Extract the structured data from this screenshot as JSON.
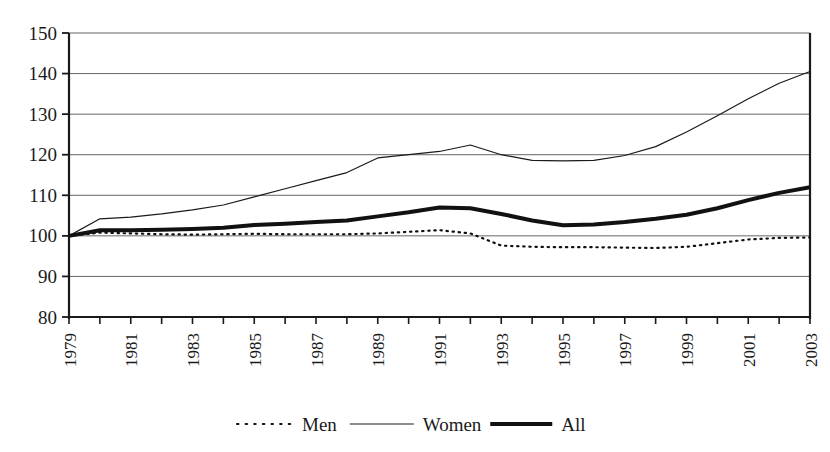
{
  "chart_data": {
    "type": "line",
    "title": "",
    "subtitle": "",
    "xlabel": "",
    "ylabel": "",
    "xlim": [
      1979,
      2003
    ],
    "ylim": [
      80,
      150
    ],
    "yticks": [
      80,
      90,
      100,
      110,
      120,
      130,
      140,
      150
    ],
    "ytick_labels": [
      "80",
      "90",
      "100",
      "110",
      "120",
      "130",
      "140",
      "150"
    ],
    "grid": true,
    "grid_axis": "y",
    "legend_position": "bottom",
    "x": [
      1979,
      1980,
      1981,
      1982,
      1983,
      1984,
      1985,
      1986,
      1987,
      1988,
      1989,
      1990,
      1991,
      1992,
      1993,
      1994,
      1995,
      1996,
      1997,
      1998,
      1999,
      2000,
      2001,
      2002,
      2003
    ],
    "xtick_labels": [
      "1979",
      "",
      "1981",
      "",
      "1983",
      "",
      "1985",
      "",
      "1987",
      "",
      "1989",
      "",
      "1991",
      "",
      "1993",
      "",
      "1995",
      "",
      "1997",
      "",
      "1999",
      "",
      "2001",
      "",
      "2003"
    ],
    "xtick_values": [
      "1979",
      "1981",
      "1983",
      "1985",
      "1987",
      "1989",
      "1991",
      "1993",
      "1995",
      "1997",
      "1999",
      "2001",
      "2003"
    ],
    "series": [
      {
        "name": "Men",
        "style": "dotted",
        "color": "#111111",
        "width": 2.2,
        "values": [
          100.0,
          100.8,
          100.6,
          100.4,
          100.3,
          100.4,
          100.5,
          100.4,
          100.4,
          100.4,
          100.6,
          101.0,
          101.4,
          100.6,
          97.6,
          97.3,
          97.2,
          97.2,
          97.1,
          97.0,
          97.3,
          98.2,
          99.1,
          99.5,
          99.6
        ]
      },
      {
        "name": "Women",
        "style": "solid",
        "color": "#1a1a1a",
        "width": 1.2,
        "values": [
          100.0,
          104.2,
          104.6,
          105.4,
          106.4,
          107.6,
          109.6,
          111.6,
          113.6,
          115.6,
          119.2,
          120.0,
          120.8,
          122.4,
          120.0,
          118.6,
          118.5,
          118.6,
          119.8,
          122.0,
          125.6,
          129.6,
          133.8,
          137.6,
          140.5
        ]
      },
      {
        "name": "All",
        "style": "solid",
        "color": "#111111",
        "width": 4.0,
        "values": [
          100.0,
          101.4,
          101.4,
          101.5,
          101.7,
          102.0,
          102.7,
          103.0,
          103.4,
          103.8,
          104.8,
          105.8,
          107.0,
          106.8,
          105.4,
          103.8,
          102.6,
          102.8,
          103.4,
          104.2,
          105.2,
          106.8,
          108.8,
          110.6,
          112.0
        ]
      }
    ],
    "legend": [
      {
        "label": "Men",
        "style": "dotted"
      },
      {
        "label": "Women",
        "style": "thin-solid"
      },
      {
        "label": "All",
        "style": "thick-solid"
      }
    ]
  },
  "colors": {
    "axis": "#1a1a1a",
    "grid": "#555555",
    "background": "#ffffff",
    "text": "#1a1a1a"
  }
}
